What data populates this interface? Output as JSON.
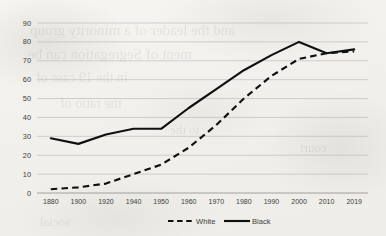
{
  "chart_data": {
    "type": "line",
    "title": "",
    "xlabel": "",
    "ylabel": "",
    "categories": [
      "1880",
      "1900",
      "1920",
      "1940",
      "1950",
      "1960",
      "1970",
      "1980",
      "1990",
      "2000",
      "2010",
      "2019"
    ],
    "yticks": [
      0,
      10,
      20,
      30,
      40,
      50,
      60,
      70,
      80,
      90
    ],
    "ylim": [
      0,
      90
    ],
    "grid": true,
    "legend_position": "bottom",
    "series": [
      {
        "name": "White",
        "style": "dashed",
        "color": "#101010",
        "values": [
          2,
          3,
          5,
          10,
          15,
          24,
          36,
          50,
          62,
          71,
          74,
          75
        ]
      },
      {
        "name": "Black",
        "style": "solid",
        "color": "#101010",
        "values": [
          29,
          26,
          31,
          34,
          34,
          45,
          55,
          65,
          73,
          80,
          74,
          76
        ]
      }
    ]
  },
  "legend": {
    "entries": [
      {
        "label": "White",
        "style": "dashed"
      },
      {
        "label": "Black",
        "style": "solid"
      }
    ]
  },
  "background": {
    "bleed_text": [
      "and the leader of a minority group",
      "ment of Segregation can be",
      "in the 19  case of",
      "the ratio of",
      "to the",
      "court",
      "social"
    ]
  },
  "colors": {
    "line": "#101010",
    "grid": "#b9b9b9",
    "axis": "#8e8e8e",
    "paper": "#f3f2ef",
    "text": "#3c3c3c"
  }
}
